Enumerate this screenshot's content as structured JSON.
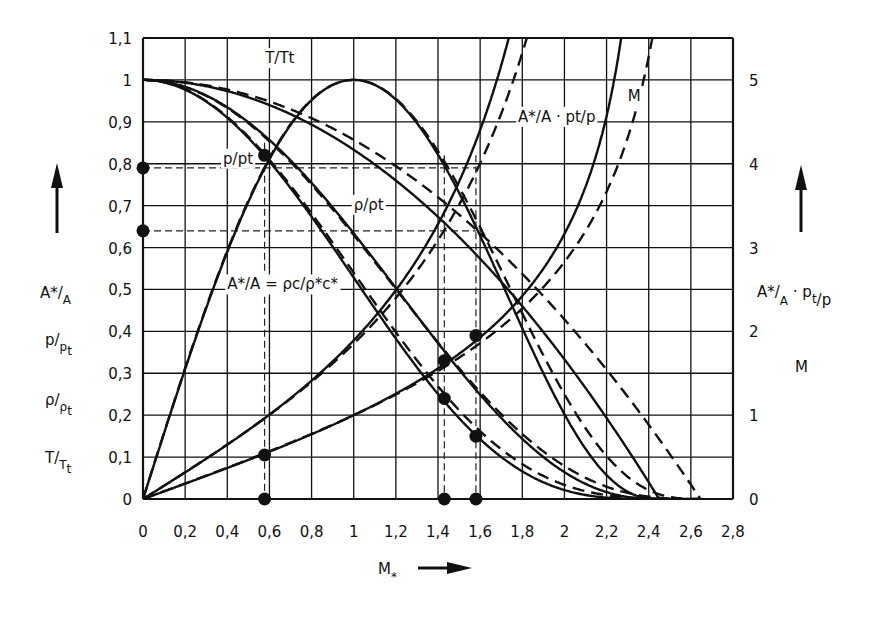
{
  "chart_data": {
    "type": "line",
    "title": "",
    "xlabel": "M*",
    "ylabel_left": [
      "A*/A",
      "p/pt",
      "ρ/ρt",
      "T/Tt"
    ],
    "ylabel_right": [
      "A*/A · pt/p",
      "M"
    ],
    "xlim": [
      0,
      2.8
    ],
    "ylim_left": [
      0,
      1.1
    ],
    "ylim_right": [
      0,
      5.5
    ],
    "grid": true,
    "x_ticks": [
      "0",
      "0,2",
      "0,4",
      "0,6",
      "0,8",
      "1",
      "1,2",
      "1,4",
      "1,6",
      "1,8",
      "2",
      "2,2",
      "2,4",
      "2,6",
      "2,8"
    ],
    "y_ticks_left": [
      "0",
      "0,1",
      "0,2",
      "0,3",
      "0,4",
      "0,5",
      "0,6",
      "0,7",
      "0,8",
      "0,9",
      "1",
      "1,1"
    ],
    "y_ticks_right": [
      "0",
      "1",
      "2",
      "3",
      "4",
      "5"
    ],
    "line_styles": {
      "solid": "gamma = 1.4",
      "dashed": "gamma ≈ 4/3"
    },
    "x": [
      0,
      0.2,
      0.4,
      0.6,
      0.8,
      1.0,
      1.2,
      1.4,
      1.6,
      1.8,
      2.0,
      2.2,
      2.4,
      2.6
    ],
    "series": [
      {
        "name": "T/Tt",
        "style": "solid",
        "axis": "left",
        "values": [
          1,
          0.9933,
          0.9733,
          0.94,
          0.8933,
          0.8333,
          0.76,
          0.6733,
          0.5733,
          0.46,
          0.3333,
          0.1933,
          0.04,
          null
        ]
      },
      {
        "name": "p/pt",
        "style": "solid",
        "axis": "left",
        "values": [
          1,
          0.9767,
          0.9097,
          0.8052,
          0.6733,
          0.5283,
          0.3827,
          0.2509,
          0.143,
          0.0659,
          0.0214,
          0.0032,
          0.0,
          null
        ]
      },
      {
        "name": "ρ/ρt",
        "style": "solid",
        "axis": "left",
        "values": [
          1,
          0.9834,
          0.9346,
          0.8566,
          0.7542,
          0.6339,
          0.5035,
          0.372,
          0.2489,
          0.1435,
          0.0641,
          0.0164,
          0.0003,
          null
        ]
      },
      {
        "name": "A*/A",
        "style": "solid",
        "axis": "left",
        "values": [
          0,
          0.3103,
          0.5897,
          0.8108,
          0.9518,
          1.0,
          0.9531,
          0.8216,
          0.6282,
          0.4075,
          0.2022,
          0.0569,
          0.0012,
          null
        ]
      },
      {
        "name": "A*/A · pt/p",
        "style": "solid",
        "axis": "right",
        "values": [
          0,
          0.3177,
          0.6483,
          1.0069,
          1.4128,
          1.893,
          2.4906,
          3.28,
          4.4,
          6.17,
          null,
          null,
          null,
          null
        ]
      },
      {
        "name": "M",
        "style": "solid",
        "axis": "right",
        "values": [
          0,
          0.1826,
          0.3675,
          0.559,
          0.7588,
          1.0,
          1.2536,
          1.5602,
          1.9427,
          2.4,
          3.1623,
          4.3,
          6.0,
          null
        ]
      },
      {
        "name": "T/Tt",
        "style": "dashed",
        "axis": "left",
        "values": [
          1,
          0.9943,
          0.9771,
          0.9486,
          0.9086,
          0.8571,
          0.7943,
          0.72,
          0.6343,
          0.5371,
          0.4286,
          0.3086,
          0.1771,
          0.0343
        ]
      },
      {
        "name": "p/pt",
        "style": "dashed",
        "axis": "left",
        "values": [
          1,
          0.9774,
          0.9115,
          0.8096,
          0.6815,
          0.5398,
          0.3981,
          0.2687,
          0.1619,
          0.0832,
          0.0337,
          0.0091,
          0.001,
          0.0
        ]
      },
      {
        "name": "ρ/ρt",
        "style": "dashed",
        "axis": "left",
        "values": [
          1,
          0.983,
          0.9329,
          0.8535,
          0.7501,
          0.6297,
          0.5011,
          0.3732,
          0.2552,
          0.1549,
          0.0787,
          0.0294,
          0.0056,
          0.0
        ]
      },
      {
        "name": "A*/A",
        "style": "dashed",
        "axis": "left",
        "values": [
          0,
          0.3122,
          0.5926,
          0.8132,
          0.953,
          1.0,
          0.9549,
          0.8297,
          0.6484,
          0.4428,
          0.25,
          0.1027,
          0.0213,
          0.0002
        ]
      },
      {
        "name": "A*/A · pt/p",
        "style": "dashed",
        "axis": "right",
        "values": [
          0,
          0.3194,
          0.6501,
          1.0045,
          1.3982,
          1.8529,
          2.3994,
          3.088,
          4.006,
          5.32,
          null,
          null,
          null,
          null
        ]
      },
      {
        "name": "M",
        "style": "dashed",
        "axis": "right",
        "values": [
          0,
          0.1852,
          0.3727,
          0.5669,
          0.7691,
          1.0,
          1.2466,
          1.5275,
          1.86,
          2.274,
          2.828,
          3.667,
          5.28,
          null
        ]
      }
    ],
    "annotations": [
      {
        "text": "T/Tt",
        "x": 0.58,
        "y": 1.04
      },
      {
        "text": "p/pt",
        "x": 0.38,
        "y": 0.8
      },
      {
        "text": "ρ/ρt",
        "x": 1.0,
        "y": 0.69
      },
      {
        "text": "A*/A = ρc/ρ*c*",
        "x": 0.4,
        "y": 0.5
      },
      {
        "text": "A*/A · pt/p",
        "x": 1.78,
        "y": 0.9
      },
      {
        "text": "M",
        "x": 2.3,
        "y": 0.95
      }
    ],
    "reference_points": {
      "vertical_dashed_x": [
        0.577,
        1.43,
        1.58
      ],
      "horizontal_dashed_y": [
        0.79,
        0.64
      ],
      "markers": [
        {
          "x": 0,
          "y": 0.79
        },
        {
          "x": 0,
          "y": 0.64
        },
        {
          "x": 0.577,
          "y": 0.82
        },
        {
          "x": 0.577,
          "y": 0.105
        },
        {
          "x": 0.577,
          "y": 0
        },
        {
          "x": 1.43,
          "y": 0.33
        },
        {
          "x": 1.43,
          "y": 0.24
        },
        {
          "x": 1.43,
          "y": 0
        },
        {
          "x": 1.58,
          "y": 0.39
        },
        {
          "x": 1.58,
          "y": 0.15
        },
        {
          "x": 1.58,
          "y": 0
        }
      ]
    }
  },
  "labels": {
    "x_axis": "M",
    "x_axis_sub": "*",
    "left_axis": [
      {
        "main": "A*/",
        "sub": "A"
      },
      {
        "main": "p/",
        "sub": "pt"
      },
      {
        "main": "ρ/",
        "sub": "ρt"
      },
      {
        "main": "T/",
        "sub": "Tt"
      }
    ],
    "right_axis": [
      {
        "main": "A*/A · pt/p"
      },
      {
        "main": "M"
      }
    ]
  }
}
